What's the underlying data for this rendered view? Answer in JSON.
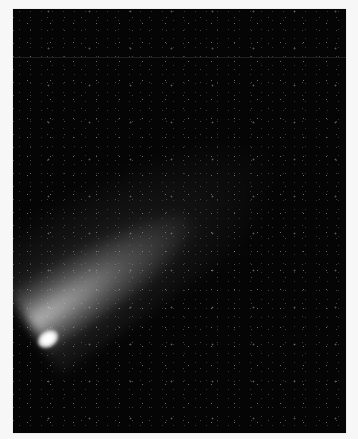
{
  "image": {
    "subject": "comet with diffuse tail against a star field",
    "colors": {
      "background": "#f7f7f7",
      "sky": "#050505",
      "nucleus": "#ffffff"
    }
  }
}
